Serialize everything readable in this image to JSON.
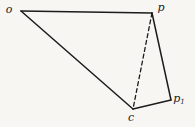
{
  "figure": {
    "background_color": "#f7f6f3",
    "stroke_color": "#1c1c1c",
    "label_color": "#1c1c1c",
    "points": {
      "o": {
        "x": 21,
        "y": 11
      },
      "p": {
        "x": 152,
        "y": 13
      },
      "p1": {
        "x": 171,
        "y": 100
      },
      "c": {
        "x": 133,
        "y": 109
      }
    },
    "edges": [
      {
        "from": "o",
        "to": "p",
        "style": "solid"
      },
      {
        "from": "o",
        "to": "c",
        "style": "solid"
      },
      {
        "from": "p",
        "to": "p1",
        "style": "solid"
      },
      {
        "from": "c",
        "to": "p1",
        "style": "solid"
      },
      {
        "from": "p",
        "to": "c",
        "style": "dashed"
      }
    ],
    "labels": [
      {
        "name": "vertex-label-o",
        "text": "o",
        "sub": "",
        "x": 9,
        "y": 13
      },
      {
        "name": "vertex-label-p",
        "text": "p",
        "sub": "",
        "x": 161,
        "y": 11
      },
      {
        "name": "vertex-label-p1",
        "text": "p",
        "sub": "1",
        "x": 179,
        "y": 102
      },
      {
        "name": "vertex-label-c",
        "text": "c",
        "sub": "",
        "x": 131,
        "y": 121
      }
    ]
  }
}
